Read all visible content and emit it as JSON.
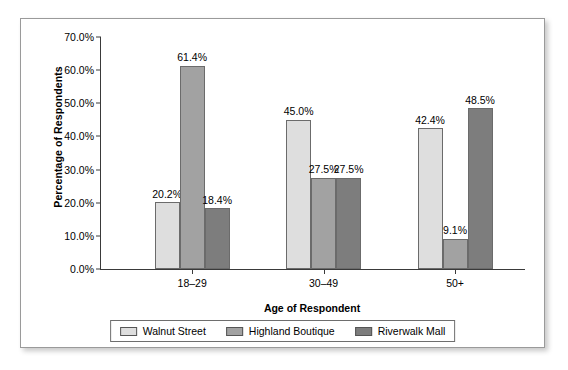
{
  "chart_data": {
    "type": "bar",
    "title": "",
    "xlabel": "Age of Respondent",
    "ylabel": "Percentage of Respondents",
    "categories": [
      "18–29",
      "30–49",
      "50+"
    ],
    "series": [
      {
        "name": "Walnut Street",
        "color": "#dedede",
        "values": [
          20.2,
          45.0,
          42.4
        ],
        "labels": [
          "20.2%",
          "45.0%",
          "42.4%"
        ]
      },
      {
        "name": "Highland Boutique",
        "color": "#a2a2a2",
        "values": [
          61.4,
          27.5,
          9.1
        ],
        "labels": [
          "61.4%",
          "27.5%",
          "9.1%"
        ]
      },
      {
        "name": "Riverwalk Mall",
        "color": "#7d7d7d",
        "values": [
          18.4,
          27.5,
          48.5
        ],
        "labels": [
          "18.4%",
          "27.5%",
          "48.5%"
        ]
      }
    ],
    "ylim": [
      0,
      70
    ],
    "ytick_step": 10,
    "ytick_labels": [
      "70.0%",
      "60.0%",
      "50.0%",
      "40.0%",
      "30.0%",
      "20.0%",
      "10.0%",
      "0.0%"
    ],
    "ytick_values": [
      70,
      60,
      50,
      40,
      30,
      20,
      10,
      0
    ],
    "grid": false,
    "legend_position": "bottom"
  },
  "axes": {
    "y_title": "Percentage of Respondents",
    "x_title": "Age of Respondent"
  },
  "legend": {
    "items": [
      {
        "label": "Walnut Street",
        "swatch": "legend-swatch-walnut-street"
      },
      {
        "label": "Highland Boutique",
        "swatch": "legend-swatch-highland-boutique"
      },
      {
        "label": "Riverwalk Mall",
        "swatch": "legend-swatch-riverwalk-mall"
      }
    ]
  },
  "colors": {
    "series_light": "#dedede",
    "series_medium": "#a2a2a2",
    "series_dark": "#7d7d7d",
    "axis": "#3a3a3a",
    "frame": "#9a9a9a",
    "background": "#ffffff"
  }
}
